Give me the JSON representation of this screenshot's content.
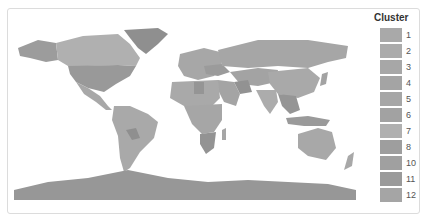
{
  "legend": {
    "title": "Cluster",
    "items": [
      {
        "label": "1",
        "color": "#a9a9a9"
      },
      {
        "label": "2",
        "color": "#ababab"
      },
      {
        "label": "3",
        "color": "#a7a7a7"
      },
      {
        "label": "4",
        "color": "#a4a4a4"
      },
      {
        "label": "5",
        "color": "#a6a6a6"
      },
      {
        "label": "6",
        "color": "#a2a2a2"
      },
      {
        "label": "7",
        "color": "#b0b0b0"
      },
      {
        "label": "8",
        "color": "#9e9e9e"
      },
      {
        "label": "10",
        "color": "#a0a0a0"
      },
      {
        "label": "11",
        "color": "#9a9a9a"
      },
      {
        "label": "12",
        "color": "#a5a5a5"
      }
    ]
  },
  "map": {
    "description": "World choropleth map colored by cluster",
    "colors": {
      "land_default": "#a8a8a8",
      "land_dark": "#8f8f8f",
      "land_light": "#b4b4b4",
      "antarctica": "#979797",
      "ocean": "#ffffff"
    }
  }
}
